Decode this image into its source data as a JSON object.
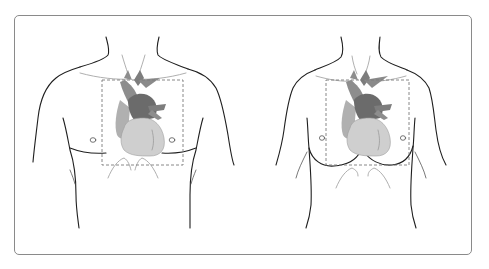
{
  "figure": {
    "panels": [
      {
        "id": "male",
        "label": "",
        "region_box": {
          "x": 102,
          "y": 80,
          "w": 81,
          "h": 85
        }
      },
      {
        "id": "female",
        "label": "",
        "region_box": {
          "x": 326,
          "y": 80,
          "w": 83,
          "h": 85
        }
      }
    ],
    "colors": {
      "frame_border": "#8a8a8a",
      "body_outline": "#1f1f1f",
      "heart_ventricles": "#cfcfcf",
      "heart_atrium_right": "#b0b0b0",
      "heart_great_vessels": "#7d7d7d",
      "heart_dark": "#6b6b6b",
      "dashed_box": "#7a7a7a"
    }
  }
}
